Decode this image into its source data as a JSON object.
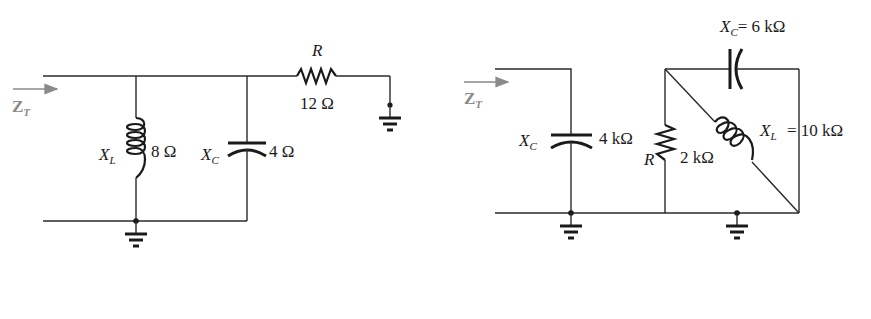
{
  "circuit_a": {
    "impedance_label": "Z",
    "impedance_subscript": "T",
    "inductor": {
      "symbol": "X",
      "subscript": "L",
      "value": "8 Ω"
    },
    "capacitor": {
      "symbol": "X",
      "subscript": "C",
      "value": "4 Ω"
    },
    "resistor": {
      "symbol": "R",
      "value": "12 Ω"
    }
  },
  "circuit_b": {
    "impedance_label": "Z",
    "impedance_subscript": "T",
    "capacitor_shunt": {
      "symbol": "X",
      "subscript": "C",
      "value": "4 kΩ"
    },
    "resistor": {
      "symbol": "R",
      "value": "2 kΩ"
    },
    "capacitor_top": {
      "symbol": "X",
      "subscript": "C",
      "equals": "= 6 kΩ"
    },
    "inductor": {
      "symbol": "X",
      "subscript": "L",
      "equals": "= 10 kΩ"
    }
  },
  "colors": {
    "wire": "#2a2a2a",
    "annotation": "#8a8a8a",
    "background": "#ffffff"
  }
}
